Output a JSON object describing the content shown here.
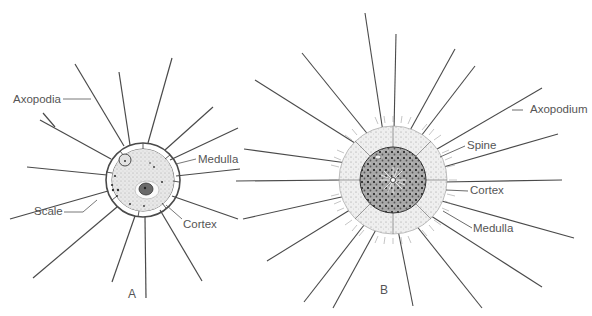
{
  "figure": {
    "panels": [
      {
        "id": "A",
        "label": "A",
        "labels": {
          "axopodia": "Axopodia",
          "medulla": "Medulla",
          "scale": "Scale",
          "cortex": "Cortex"
        }
      },
      {
        "id": "B",
        "label": "B",
        "labels": {
          "axopodium": "Axopodium",
          "spine": "Spine",
          "cortex": "Cortex",
          "medulla": "Medulla"
        }
      }
    ],
    "colors": {
      "line": "#4a4a4a",
      "text": "#555555",
      "cytoplasm": "#e6e6e6",
      "medulla_dark": "#8a8a8a"
    }
  }
}
